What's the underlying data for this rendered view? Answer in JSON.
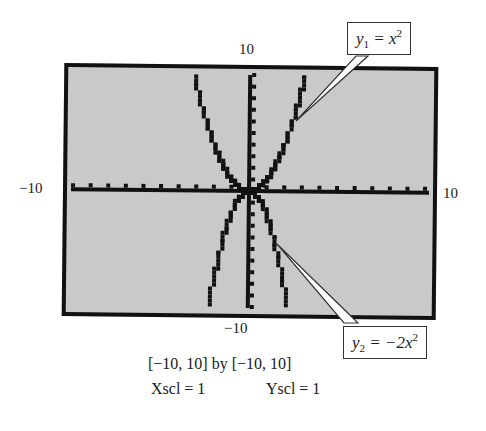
{
  "chart_data": {
    "type": "line",
    "title": "",
    "xlabel": "",
    "ylabel": "",
    "xlim": [
      -10,
      10
    ],
    "ylim": [
      -10,
      10
    ],
    "xscl": 1,
    "yscl": 1,
    "grid": false,
    "series": [
      {
        "name": "y1 = x^2",
        "function": "x^2",
        "x": [
          -3.2,
          -3,
          -2.5,
          -2,
          -1.5,
          -1,
          -0.5,
          0,
          0.5,
          1,
          1.5,
          2,
          2.5,
          3,
          3.2
        ],
        "y": [
          10.24,
          9,
          6.25,
          4,
          2.25,
          1,
          0.25,
          0,
          0.25,
          1,
          2.25,
          4,
          6.25,
          9,
          10.24
        ]
      },
      {
        "name": "y2 = -2x^2",
        "function": "-2x^2",
        "x": [
          -2.24,
          -2,
          -1.5,
          -1,
          -0.5,
          0,
          0.5,
          1,
          1.5,
          2,
          2.24
        ],
        "y": [
          -10,
          -8,
          -4.5,
          -2,
          -0.5,
          0,
          -0.5,
          -2,
          -4.5,
          -8,
          -10
        ]
      }
    ],
    "tick_labels": {
      "y_top": "10",
      "y_bottom": "-10",
      "x_left": "-10",
      "x_right": "10"
    },
    "annotations": [
      "y1 = x^2",
      "y2 = -2x^2"
    ]
  },
  "labels": {
    "y_max": "10",
    "y_min": "−10",
    "x_min": "−10",
    "x_max": "10"
  },
  "callouts": {
    "y1": {
      "var": "y",
      "sub": "1",
      "rhs": " = x",
      "exp": "2"
    },
    "y2": {
      "var": "y",
      "sub": "2",
      "rhs": " = −2x",
      "exp": "2"
    }
  },
  "caption": {
    "window": "[−10, 10] by [−10, 10]",
    "xscl": "Xscl = 1",
    "yscl": "Yscl = 1"
  },
  "colors": {
    "screen_bg": "#c9c9c9",
    "ink": "#111111",
    "frame": "#111111"
  }
}
